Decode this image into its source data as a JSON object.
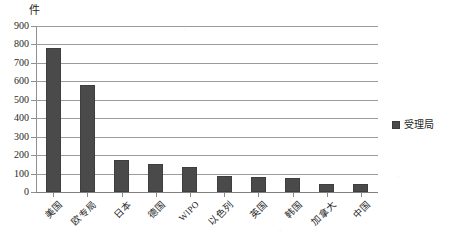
{
  "chart_data": {
    "type": "bar",
    "title": "",
    "subtitle": "",
    "xlabel": "",
    "ylabel": "件",
    "unit_label": "件",
    "ylim": [
      0,
      900
    ],
    "ytick_step": 100,
    "yticks": [
      "900",
      "800",
      "700",
      "600",
      "500",
      "400",
      "300",
      "200",
      "100",
      "0"
    ],
    "ytick_values": [
      900,
      800,
      700,
      600,
      500,
      400,
      300,
      200,
      100,
      0
    ],
    "grid": true,
    "grid_axis": "y",
    "legend_position": "right",
    "categories": [
      "美国",
      "欧专局",
      "日本",
      "德国",
      "WIPO",
      "以色列",
      "英国",
      "韩国",
      "加拿大",
      "中国"
    ],
    "series": [
      {
        "name": "受理局",
        "color": "#4a4a4a",
        "values": [
          780,
          580,
          175,
          150,
          135,
          85,
          80,
          75,
          45,
          45
        ]
      }
    ],
    "bars": [
      {
        "category": "美国",
        "value": 780,
        "latin": false
      },
      {
        "category": "欧专局",
        "value": 580,
        "latin": false
      },
      {
        "category": "日本",
        "value": 175,
        "latin": false
      },
      {
        "category": "德国",
        "value": 150,
        "latin": false
      },
      {
        "category": "WIPO",
        "value": 135,
        "latin": true
      },
      {
        "category": "以色列",
        "value": 85,
        "latin": false
      },
      {
        "category": "英国",
        "value": 80,
        "latin": false
      },
      {
        "category": "韩国",
        "value": 75,
        "latin": false
      },
      {
        "category": "加拿大",
        "value": 45,
        "latin": false
      },
      {
        "category": "中国",
        "value": 45,
        "latin": false
      }
    ]
  },
  "legend": {
    "entries": [
      {
        "label": "受理局",
        "color": "#4a4a4a"
      }
    ]
  },
  "colors": {
    "bar": "#4a4a4a",
    "bar_border": "#3e3e3e",
    "gridline": "#9b9b9b",
    "axis": "#8a8a8a",
    "text": "#1f1f1f",
    "background": "#ffffff"
  }
}
